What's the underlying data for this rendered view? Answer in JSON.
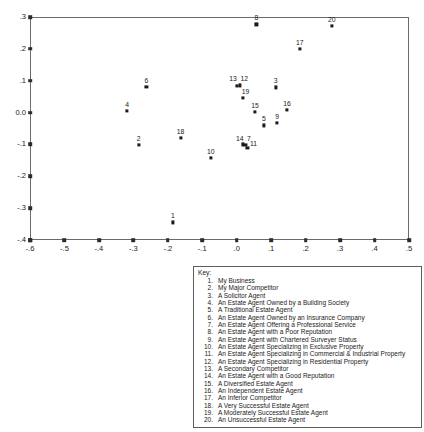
{
  "chart_data": {
    "type": "scatter",
    "title": "",
    "subtitle": "",
    "xlabel": "",
    "ylabel": "",
    "xlim": [
      -0.6,
      0.5
    ],
    "ylim": [
      -0.4,
      0.3
    ],
    "grid": false,
    "legend_position": "below-plot",
    "x_ticks": [
      -0.6,
      -0.5,
      -0.4,
      -0.3,
      -0.2,
      -0.1,
      0.0,
      0.1,
      0.2,
      0.3,
      0.4,
      0.5
    ],
    "x_tick_labels": [
      "-.6",
      "-.5",
      "-.4",
      "-.3",
      "-.2",
      "-.1",
      ".0",
      ".1",
      ".2",
      ".3",
      ".4",
      ".5"
    ],
    "y_ticks": [
      -0.4,
      -0.3,
      -0.2,
      -0.1,
      0.0,
      0.1,
      0.2,
      0.3
    ],
    "y_tick_labels": [
      "-.4",
      "-.3",
      "-.2",
      "-.1",
      "0.0",
      ".1",
      ".2",
      ".3"
    ],
    "point_color": "#1a1a1a",
    "points": [
      {
        "label": "1",
        "x": -0.185,
        "y": -0.345,
        "label_dx": 0,
        "label_dy": -3
      },
      {
        "label": "2",
        "x": -0.285,
        "y": -0.102,
        "label_dx": 0,
        "label_dy": -3
      },
      {
        "label": "3",
        "x": 0.113,
        "y": 0.079,
        "label_dx": 0,
        "label_dy": -3
      },
      {
        "label": "4",
        "x": -0.318,
        "y": 0.005,
        "label_dx": 0,
        "label_dy": -3
      },
      {
        "label": "5",
        "x": 0.079,
        "y": -0.04,
        "label_dx": 0,
        "label_dy": -3
      },
      {
        "label": "6",
        "x": -0.262,
        "y": 0.08,
        "label_dx": 0,
        "label_dy": -3
      },
      {
        "label": "7",
        "x": 0.025,
        "y": -0.101,
        "label_dx": 3.5,
        "label_dy": -3
      },
      {
        "label": "8",
        "x": 0.057,
        "y": 0.277,
        "label_dx": 0,
        "label_dy": -3
      },
      {
        "label": "9",
        "x": 0.117,
        "y": -0.032,
        "label_dx": 0,
        "label_dy": -3
      },
      {
        "label": "10",
        "x": -0.075,
        "y": -0.143,
        "label_dx": 0,
        "label_dy": -3
      },
      {
        "label": "11",
        "x": 0.031,
        "y": -0.112,
        "label_dx": 6,
        "label_dy": -1
      },
      {
        "label": "12",
        "x": 0.01,
        "y": 0.085,
        "label_dx": 4,
        "label_dy": -3
      },
      {
        "label": "13",
        "x": 0.001,
        "y": 0.083,
        "label_dx": -4,
        "label_dy": -4
      },
      {
        "label": "14",
        "x": 0.019,
        "y": -0.1,
        "label_dx": -3.5,
        "label_dy": -2
      },
      {
        "label": "15",
        "x": 0.053,
        "y": 0.001,
        "label_dx": 0,
        "label_dy": -3
      },
      {
        "label": "16",
        "x": 0.146,
        "y": 0.008,
        "label_dx": 0,
        "label_dy": -3
      },
      {
        "label": "17",
        "x": 0.183,
        "y": 0.2,
        "label_dx": 0,
        "label_dy": -3
      },
      {
        "label": "18",
        "x": -0.163,
        "y": -0.08,
        "label_dx": 0,
        "label_dy": -3
      },
      {
        "label": "19",
        "x": 0.017,
        "y": 0.046,
        "label_dx": 3,
        "label_dy": -3
      },
      {
        "label": "20",
        "x": 0.276,
        "y": 0.272,
        "label_dx": 0,
        "label_dy": -3
      }
    ]
  },
  "key": {
    "title": "Key:",
    "items": [
      {
        "number": "1.",
        "text": "My Business"
      },
      {
        "number": "2.",
        "text": "My Major Competitor"
      },
      {
        "number": "3.",
        "text": "A Solicitor Agent"
      },
      {
        "number": "4.",
        "text": "An Estate Agent Owned by a Building Society"
      },
      {
        "number": "5.",
        "text": "A Traditional Estate Agent"
      },
      {
        "number": "6.",
        "text": "An Estate Agent Owned by an Insurance Company"
      },
      {
        "number": "7.",
        "text": "An Estate Agent Offering a Professional Service"
      },
      {
        "number": "8.",
        "text": "An Estate Agent with a Poor Reputation"
      },
      {
        "number": "9.",
        "text": "An Estate Agent with Chartered Surveyer Status"
      },
      {
        "number": "10.",
        "text": "An Estate Agent Specializing in Exclusive Property"
      },
      {
        "number": "11.",
        "text": "An Estate Agent Specializing in Commercial & Industrial Property"
      },
      {
        "number": "12.",
        "text": "An Estate Agent Specializing in Residential Property"
      },
      {
        "number": "13.",
        "text": "A Secondary Competitor"
      },
      {
        "number": "14.",
        "text": "An Estate Agent with a Good Reputation"
      },
      {
        "number": "15.",
        "text": "A Diversified Estate Agent"
      },
      {
        "number": "16.",
        "text": "An Independent Estate Agent"
      },
      {
        "number": "17.",
        "text": "An Inferior Competitor"
      },
      {
        "number": "18.",
        "text": "A Very Successful Estate Agent"
      },
      {
        "number": "19.",
        "text": "A Moderately Successful Estate Agent"
      },
      {
        "number": "20.",
        "text": "An Unsuccessful Estate Agent"
      }
    ]
  }
}
